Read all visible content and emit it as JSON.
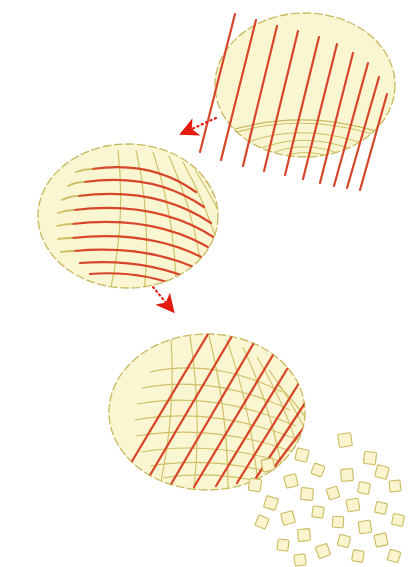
{
  "figure": {
    "background_color": "#ffffff",
    "width": 411,
    "height": 567,
    "palette": {
      "surface_fill": "#faf6d2",
      "surface_fill_light": "#fbf8dc",
      "surface_outline": "#c9b95e",
      "mesh_line": "#cdbd62",
      "red_line": "#d8462a",
      "red_line_dark": "#c63c20",
      "arrow": "#e21b0c",
      "tile_fill": "#faf4cf",
      "tile_outline": "#cbbb60"
    },
    "panels": [
      {
        "id": "panel-top",
        "name": "striped-ellipse-top",
        "label": "Sphere with parallel straight cut lines",
        "center": [
          305,
          85
        ],
        "rx": 90,
        "ry": 72,
        "red_line_count": 10,
        "red_line_style": "straight parallel diagonal",
        "red_line_angle_deg": 76,
        "mesh_type": "faint nested arcs at lower rim"
      },
      {
        "id": "panel-middle",
        "name": "dome-with-latitude-curves",
        "label": "Dome with curved latitude bands and faint meridians",
        "center": [
          128,
          216
        ],
        "rx": 90,
        "ry": 72,
        "red_curve_count": 9,
        "red_line_style": "curved latitude arcs",
        "mesh_type": "faint meridian curves crossing arcs"
      },
      {
        "id": "panel-bottom",
        "name": "dome-with-diagonal-grid",
        "label": "Dome overlaid with diagonal red grid and faint curved mesh",
        "center": [
          207,
          412
        ],
        "rx": 98,
        "ry": 78,
        "red_line_count": 9,
        "red_line_style": "straight parallel diagonal over curved mesh",
        "red_line_angle_deg": 60,
        "mesh_type": "curved quad mesh"
      }
    ],
    "arrows": [
      {
        "id": "arrow-1",
        "name": "transform-arrow-top-to-middle",
        "direction": "left-down",
        "from": [
          215,
          119
        ],
        "to": [
          168,
          140
        ],
        "style": "dotted tail with solid triangular head",
        "color": "#e21b0c"
      },
      {
        "id": "arrow-2",
        "name": "transform-arrow-middle-to-bottom",
        "direction": "down-right",
        "from": [
          155,
          288
        ],
        "to": [
          178,
          318
        ],
        "style": "dotted tail with solid triangular head",
        "color": "#e21b0c"
      }
    ],
    "tiles": {
      "name": "scattered-square-tiles",
      "label": "Scattered flat square tiles decomposed from the surface",
      "count": 30,
      "fill": "#faf4cf",
      "outline": "#cbbb60",
      "size_range": [
        9,
        14
      ],
      "region": [
        258,
        425,
        150,
        140
      ],
      "items": [
        {
          "x": 345,
          "y": 440,
          "s": 13,
          "r": -8
        },
        {
          "x": 302,
          "y": 455,
          "s": 12,
          "r": 14
        },
        {
          "x": 370,
          "y": 458,
          "s": 12,
          "r": 6
        },
        {
          "x": 268,
          "y": 465,
          "s": 12,
          "r": -12
        },
        {
          "x": 318,
          "y": 470,
          "s": 11,
          "r": 20
        },
        {
          "x": 347,
          "y": 475,
          "s": 12,
          "r": -4
        },
        {
          "x": 382,
          "y": 472,
          "s": 12,
          "r": 16
        },
        {
          "x": 255,
          "y": 485,
          "s": 12,
          "r": 9
        },
        {
          "x": 291,
          "y": 481,
          "s": 12,
          "r": -14
        },
        {
          "x": 364,
          "y": 488,
          "s": 11,
          "r": 11
        },
        {
          "x": 307,
          "y": 494,
          "s": 12,
          "r": 5
        },
        {
          "x": 333,
          "y": 493,
          "s": 11,
          "r": -18
        },
        {
          "x": 395,
          "y": 486,
          "s": 11,
          "r": -6
        },
        {
          "x": 271,
          "y": 503,
          "s": 12,
          "r": 17
        },
        {
          "x": 353,
          "y": 505,
          "s": 12,
          "r": -10
        },
        {
          "x": 318,
          "y": 512,
          "s": 11,
          "r": 8
        },
        {
          "x": 381,
          "y": 508,
          "s": 11,
          "r": 13
        },
        {
          "x": 288,
          "y": 518,
          "s": 12,
          "r": -16
        },
        {
          "x": 338,
          "y": 522,
          "s": 11,
          "r": 3
        },
        {
          "x": 365,
          "y": 527,
          "s": 12,
          "r": -9
        },
        {
          "x": 398,
          "y": 520,
          "s": 11,
          "r": 12
        },
        {
          "x": 262,
          "y": 522,
          "s": 11,
          "r": 22
        },
        {
          "x": 304,
          "y": 535,
          "s": 12,
          "r": -5
        },
        {
          "x": 344,
          "y": 541,
          "s": 11,
          "r": 15
        },
        {
          "x": 381,
          "y": 540,
          "s": 12,
          "r": -12
        },
        {
          "x": 283,
          "y": 545,
          "s": 11,
          "r": 7
        },
        {
          "x": 323,
          "y": 551,
          "s": 12,
          "r": -20
        },
        {
          "x": 358,
          "y": 556,
          "s": 11,
          "r": 10
        },
        {
          "x": 300,
          "y": 560,
          "s": 11,
          "r": -7
        },
        {
          "x": 394,
          "y": 556,
          "s": 11,
          "r": 18
        }
      ]
    }
  }
}
